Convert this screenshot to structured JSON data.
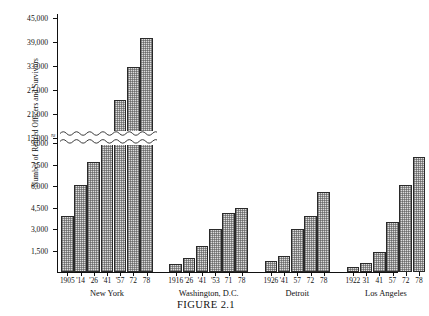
{
  "figure": {
    "caption": "FIGURE 2.1",
    "ylabel": "Number of Retired Officers and Survivors"
  },
  "chart_data": {
    "type": "bar",
    "title": "FIGURE 2.1",
    "xlabel": "",
    "ylabel": "Number of Retired Officers and Survivors",
    "ylim": [
      0,
      45000
    ],
    "grid": false,
    "legend": "none",
    "axis_break": {
      "from": 9000,
      "to": 15000,
      "style": "wavy"
    },
    "ytick_labels": [
      "1,500",
      "3,000",
      "4,500",
      "6,000",
      "7,500",
      "9,000",
      "15,000",
      "21,000",
      "27,000",
      "33,000",
      "39,000",
      "45,000"
    ],
    "ytick_values": [
      1500,
      3000,
      4500,
      6000,
      7500,
      9000,
      15000,
      21000,
      27000,
      33000,
      39000,
      45000
    ],
    "groups": [
      {
        "name": "New York",
        "categories": [
          "1905",
          "'14",
          "'26",
          "'41",
          "'57",
          "72",
          "78"
        ],
        "values": [
          3900,
          6100,
          9100,
          13500,
          24400,
          32800,
          40000
        ]
      },
      {
        "name": "Washington, D.C.",
        "categories": [
          "1916",
          "'26",
          "'41",
          "'53",
          "71",
          "78"
        ],
        "values": [
          550,
          1000,
          1800,
          3000,
          4100,
          4500
        ]
      },
      {
        "name": "Detroit",
        "categories": [
          "1926",
          "'41",
          "57",
          "72",
          "78"
        ],
        "values": [
          800,
          1100,
          3000,
          3900,
          5600
        ]
      },
      {
        "name": "Los Angeles",
        "categories": [
          "1922",
          "31",
          "41",
          "57",
          "72",
          "78"
        ],
        "values": [
          350,
          600,
          1400,
          3500,
          6100,
          8000
        ]
      }
    ]
  }
}
